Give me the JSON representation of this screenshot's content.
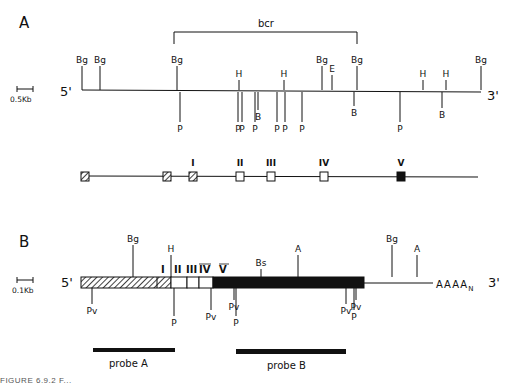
{
  "panelA": {
    "label": "A",
    "scale": "0.5Kb",
    "bcr_label": "bcr",
    "five_prime": "5'",
    "three_prime": "3'",
    "map": {
      "above": [
        {
          "x": 82,
          "label": "Bg",
          "len": 24
        },
        {
          "x": 100,
          "label": "Bg",
          "len": 24
        },
        {
          "x": 177,
          "label": "Bg",
          "len": 24
        },
        {
          "x": 239,
          "label": "H",
          "len": 10
        },
        {
          "x": 284,
          "label": "H",
          "len": 10
        },
        {
          "x": 322,
          "label": "Bg",
          "len": 24
        },
        {
          "x": 332,
          "label": "E",
          "len": 15
        },
        {
          "x": 357,
          "label": "Bg",
          "len": 24
        },
        {
          "x": 423,
          "label": "H",
          "len": 10
        },
        {
          "x": 446,
          "label": "H",
          "len": 10
        },
        {
          "x": 481,
          "label": "Bg",
          "len": 24
        }
      ],
      "below": [
        {
          "x": 180,
          "label": "P",
          "len": 30
        },
        {
          "x": 238,
          "label": "P",
          "len": 30
        },
        {
          "x": 242,
          "label": "P",
          "len": 30
        },
        {
          "x": 255,
          "label": "P",
          "len": 30
        },
        {
          "x": 258,
          "label": "B",
          "len": 18
        },
        {
          "x": 277,
          "label": "P",
          "len": 30
        },
        {
          "x": 285,
          "label": "P",
          "len": 30
        },
        {
          "x": 302,
          "label": "P",
          "len": 30
        },
        {
          "x": 354,
          "label": "B",
          "len": 14
        },
        {
          "x": 400,
          "label": "P",
          "len": 30
        },
        {
          "x": 442,
          "label": "B",
          "len": 16
        }
      ]
    },
    "exons": [
      {
        "x": 85,
        "style": "hatched",
        "label": ""
      },
      {
        "x": 167,
        "style": "hatched",
        "label": ""
      },
      {
        "x": 193,
        "style": "hatched",
        "label": "I"
      },
      {
        "x": 240,
        "style": "open",
        "label": "II"
      },
      {
        "x": 271,
        "style": "open",
        "label": "III"
      },
      {
        "x": 324,
        "style": "open",
        "label": "IV"
      },
      {
        "x": 401,
        "style": "filled",
        "label": "V"
      }
    ]
  },
  "panelB": {
    "label": "B",
    "scale": "0.1Kb",
    "five_prime": "5'",
    "three_prime": "3'",
    "polyA": "AAAA",
    "polyA_sub": "N",
    "above": [
      {
        "x": 133,
        "label": "Bg",
        "len": 32
      },
      {
        "x": 171,
        "label": "H",
        "len": 22
      },
      {
        "x": 261,
        "label": "Bs",
        "len": 8
      },
      {
        "x": 298,
        "label": "A",
        "len": 22
      },
      {
        "x": 392,
        "label": "Bg",
        "len": 32
      },
      {
        "x": 417,
        "label": "A",
        "len": 22
      }
    ],
    "below": [
      {
        "x": 92,
        "label": "Pv",
        "len": 16
      },
      {
        "x": 174,
        "label": "P",
        "len": 28
      },
      {
        "x": 211,
        "label": "Pv",
        "len": 22
      },
      {
        "x": 234,
        "label": "Pv",
        "len": 12
      },
      {
        "x": 236,
        "label": "P",
        "len": 28
      },
      {
        "x": 346,
        "label": "Pv",
        "len": 16
      },
      {
        "x": 354,
        "label": "P",
        "len": 22
      },
      {
        "x": 356,
        "label": "Pv",
        "len": 12
      }
    ],
    "segment_labels": [
      "I",
      "II",
      "III",
      "IV",
      "V"
    ],
    "probes": [
      {
        "label": "probe A",
        "x1": 93,
        "x2": 175
      },
      {
        "label": "probe B",
        "x1": 236,
        "x2": 346
      }
    ]
  },
  "caption": "FIGURE 6.9.2 F..."
}
